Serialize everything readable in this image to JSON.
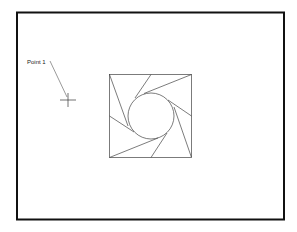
{
  "drawing": {
    "point_label": "Point 1",
    "frame": {
      "x": 17,
      "y": 12.5,
      "w": 267,
      "h": 207,
      "stroke": "#111111",
      "stroke_width": 2
    },
    "square": {
      "x": 109.5,
      "y": 74.5,
      "w": 82,
      "h": 83
    },
    "circle": {
      "cx": 151,
      "cy": 116,
      "r": 23
    },
    "line_color": "#333333",
    "marker": {
      "x": 68,
      "y": 100
    }
  }
}
